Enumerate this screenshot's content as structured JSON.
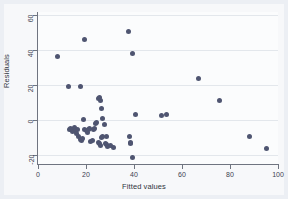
{
  "chart_data": {
    "type": "scatter",
    "title": "",
    "xlabel": "Fitted values",
    "ylabel": "Residuals",
    "xlim": [
      0,
      100
    ],
    "ylim": [
      -25,
      62
    ],
    "xticks": [
      0,
      20,
      40,
      60,
      80,
      100
    ],
    "yticks": [
      -20,
      0,
      20,
      40,
      60
    ],
    "xtick_labels": [
      "0",
      "20",
      "40",
      "60",
      "80",
      "100"
    ],
    "ytick_labels": [
      "-20",
      "0",
      "20",
      "40",
      "60"
    ],
    "grid": "horizontal-faint",
    "legend": "none",
    "marker_color": "#4f5571",
    "series": [
      {
        "name": "residuals",
        "points": [
          [
            8.0,
            36.5
          ],
          [
            12.5,
            19.5
          ],
          [
            17.5,
            19.5
          ],
          [
            19.5,
            46.0
          ],
          [
            13.0,
            -5.5
          ],
          [
            13.5,
            -4.5
          ],
          [
            14.0,
            -5.0
          ],
          [
            14.5,
            -6.5
          ],
          [
            15.0,
            -4.0
          ],
          [
            15.5,
            -6.0
          ],
          [
            16.0,
            -7.5
          ],
          [
            16.5,
            -5.5
          ],
          [
            17.0,
            -9.5
          ],
          [
            17.5,
            -11.0
          ],
          [
            18.0,
            -11.5
          ],
          [
            18.5,
            -10.5
          ],
          [
            19.0,
            0.5
          ],
          [
            19.5,
            -5.5
          ],
          [
            20.0,
            -6.0
          ],
          [
            20.5,
            -7.0
          ],
          [
            21.0,
            -5.0
          ],
          [
            21.5,
            -4.5
          ],
          [
            22.0,
            -12.0
          ],
          [
            22.5,
            -11.5
          ],
          [
            23.0,
            -5.0
          ],
          [
            23.5,
            -4.5
          ],
          [
            24.0,
            -2.0
          ],
          [
            24.5,
            -1.5
          ],
          [
            25.0,
            12.5
          ],
          [
            25.5,
            13.0
          ],
          [
            26.0,
            11.5
          ],
          [
            26.5,
            7.0
          ],
          [
            25.0,
            -12.5
          ],
          [
            25.5,
            -13.0
          ],
          [
            26.0,
            -14.5
          ],
          [
            26.5,
            -10.0
          ],
          [
            27.0,
            -9.5
          ],
          [
            27.0,
            1.0
          ],
          [
            27.5,
            -2.5
          ],
          [
            28.0,
            -13.5
          ],
          [
            28.5,
            -14.0
          ],
          [
            28.5,
            -9.5
          ],
          [
            29.0,
            -15.0
          ],
          [
            30.0,
            -14.5
          ],
          [
            31.5,
            -15.5
          ],
          [
            37.5,
            51.0
          ],
          [
            39.5,
            38.5
          ],
          [
            38.0,
            -9.0
          ],
          [
            38.5,
            -12.5
          ],
          [
            38.5,
            -13.5
          ],
          [
            39.5,
            -21.5
          ],
          [
            40.5,
            3.5
          ],
          [
            51.5,
            2.5
          ],
          [
            53.5,
            3.5
          ],
          [
            67.0,
            24.0
          ],
          [
            75.5,
            11.5
          ],
          [
            88.0,
            -9.0
          ],
          [
            95.0,
            -16.0
          ]
        ]
      }
    ]
  }
}
